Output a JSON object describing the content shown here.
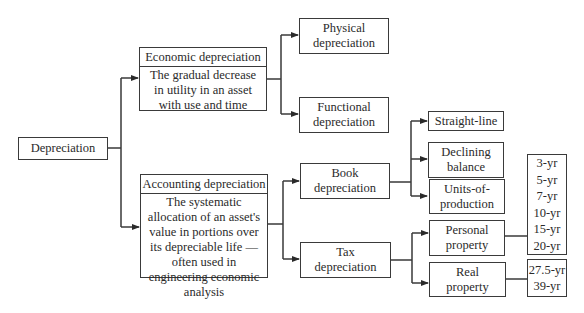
{
  "diagram": {
    "root": {
      "label": "Depreciation"
    },
    "economic": {
      "title": "Economic depreciation",
      "description": "The gradual decrease in utility in an asset with use and time",
      "children": [
        {
          "label": "Physical depreciation"
        },
        {
          "label": "Functional depreciation"
        }
      ]
    },
    "accounting": {
      "title": "Accounting depreciation",
      "description": "The systematic allocation of an asset's value in portions over its depreciable life — often used in engineering economic analysis",
      "book": {
        "label": "Book depreciation",
        "methods": [
          {
            "label": "Straight-line"
          },
          {
            "label": "Declining balance"
          },
          {
            "label": "Units-of-production"
          }
        ]
      },
      "tax": {
        "label": "Tax depreciation",
        "personal": {
          "label": "Personal property",
          "recovery_periods": [
            "3-yr",
            "5-yr",
            "7-yr",
            "10-yr",
            "15-yr",
            "20-yr"
          ]
        },
        "real": {
          "label": "Real property",
          "recovery_periods": [
            "27.5-yr",
            "39-yr"
          ]
        }
      }
    }
  }
}
